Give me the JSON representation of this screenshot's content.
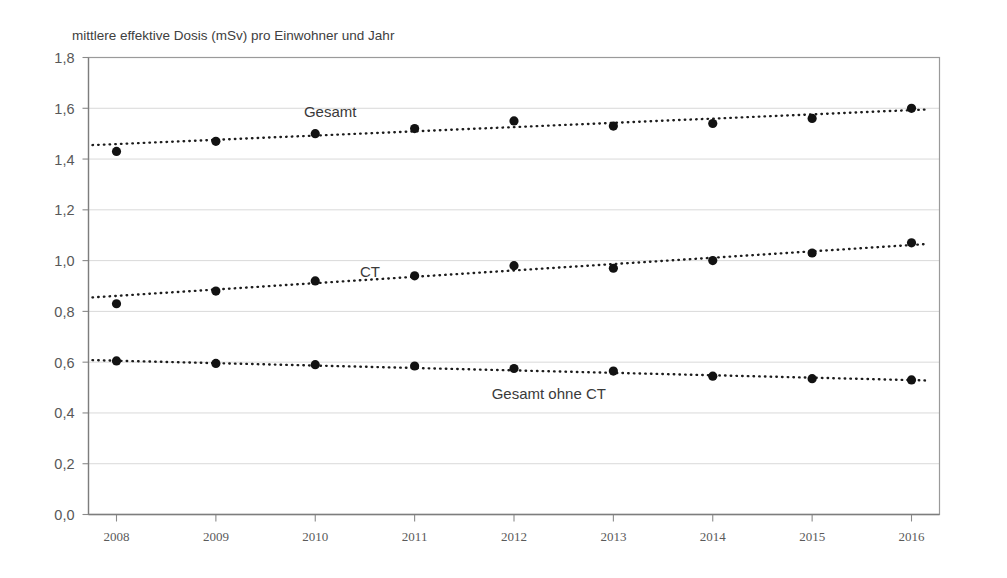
{
  "chart_data": {
    "type": "line",
    "title": "mittlere effektive Dosis (mSv) pro Einwohner und Jahr",
    "xlabel": "",
    "ylabel": "",
    "categories": [
      "2008",
      "2009",
      "2010",
      "2011",
      "2012",
      "2013",
      "2014",
      "2015",
      "2016"
    ],
    "x": [
      2008,
      2009,
      2010,
      2011,
      2012,
      2013,
      2014,
      2015,
      2016
    ],
    "ylim": [
      0.0,
      1.8
    ],
    "yticks": [
      0.0,
      0.2,
      0.4,
      0.6,
      0.8,
      1.0,
      1.2,
      1.4,
      1.6,
      1.8
    ],
    "ytick_labels": [
      "0,0",
      "0,2",
      "0,4",
      "0,6",
      "0,8",
      "1,0",
      "1,2",
      "1,4",
      "1,6",
      "1,8"
    ],
    "grid": true,
    "legend_position": "inline-annotations",
    "series": [
      {
        "name": "Gesamt",
        "label_x": 2010.15,
        "label_y": 1.565,
        "values": [
          1.43,
          1.47,
          1.5,
          1.52,
          1.55,
          1.53,
          1.54,
          1.56,
          1.6
        ],
        "trend_start": 1.455,
        "trend_end": 1.595
      },
      {
        "name": "CT",
        "label_x": 2010.55,
        "label_y": 0.935,
        "values": [
          0.83,
          0.88,
          0.92,
          0.94,
          0.98,
          0.97,
          1.0,
          1.03,
          1.07
        ],
        "trend_start": 0.855,
        "trend_end": 1.065
      },
      {
        "name": "Gesamt ohne CT",
        "label_x": 2012.35,
        "label_y": 0.455,
        "values": [
          0.605,
          0.595,
          0.59,
          0.585,
          0.575,
          0.565,
          0.545,
          0.535,
          0.53
        ],
        "trend_start": 0.608,
        "trend_end": 0.528
      }
    ]
  },
  "axis_title_text": "mittlere effektive Dosis (mSv) pro Einwohner und Jahr"
}
